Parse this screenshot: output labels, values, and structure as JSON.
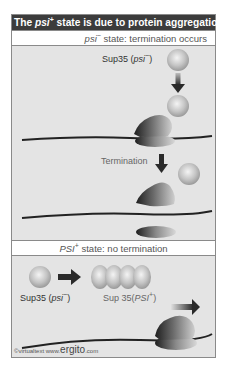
{
  "title": {
    "prefix": "The ",
    "italic": "psi",
    "sup": "+",
    "suffix": " state is due to protein aggregation"
  },
  "section1": {
    "header_italic": "psi",
    "header_sup": "−",
    "header_text": " state: termination occurs",
    "sup35_label": "Sup35 (",
    "sup35_italic": "psi",
    "sup35_sup": "−",
    "sup35_close": ")",
    "termination_label": "Termination"
  },
  "section2": {
    "header_italic": "PSI",
    "header_sup": "+",
    "header_text": " state: no termination",
    "sup35_label": "Sup35 (",
    "sup35_italic": "psi",
    "sup35_sup": "−",
    "sup35_close": ")",
    "aggregate_label": "Sup 35(",
    "aggregate_italic": "PSI",
    "aggregate_sup": "+",
    "aggregate_close": ")"
  },
  "credit": {
    "small": "©virtualtext  www.",
    "big": "ergito",
    "tail": ".com"
  },
  "colors": {
    "title_bg": "#3c3c3c",
    "panel_bg": "#e4e4e4",
    "protein": "#c8c8c8",
    "ribosome_dark": "#2a2a2a",
    "arrow": "#2a2a2a"
  }
}
